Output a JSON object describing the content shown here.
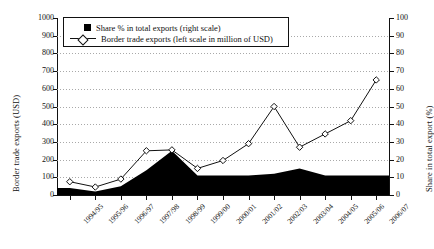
{
  "axes": {
    "left_title": "Border trade exports (USD)",
    "right_title": "Share in total export (%)",
    "left_ticks": [
      "1000",
      "900",
      "800",
      "700",
      "600",
      "500",
      "400",
      "300",
      "200",
      "100",
      "0"
    ],
    "right_ticks": [
      "100",
      "90",
      "80",
      "70",
      "60",
      "50",
      "40",
      "30",
      "20",
      "10",
      "0"
    ]
  },
  "legend": {
    "share_label": "Share % in total exports (right scale)",
    "border_label": "Border trade exports (left scale in million of USD)",
    "share_marker": "filled-square-black",
    "border_marker": "open-diamond-with-line"
  },
  "chart_data": {
    "type": "line",
    "title": "",
    "xlabel": "",
    "ylabel": "Border trade exports (USD)",
    "y2label": "Share in total export (%)",
    "ylim": [
      0,
      1000
    ],
    "y2lim": [
      0,
      100
    ],
    "grid": true,
    "legend_position": "top-left-inside",
    "categories": [
      "1994/95",
      "1995/96",
      "1996/97",
      "1997/98",
      "1998/99",
      "1999/00",
      "2000/01",
      "2001/02",
      "2002/03",
      "2003/04",
      "2004/05",
      "2005/06",
      "2006/07"
    ],
    "series": [
      {
        "name": "Border trade exports (left scale in million of USD)",
        "type": "line",
        "axis": "left",
        "marker": "diamond",
        "color": "#111111",
        "values": [
          75,
          45,
          90,
          250,
          255,
          150,
          195,
          290,
          500,
          270,
          345,
          420,
          650
        ]
      },
      {
        "name": "Share % in total exports (right scale)",
        "type": "area",
        "axis": "right",
        "color": "#000000",
        "values": [
          4,
          2,
          5,
          14,
          25,
          11,
          11,
          11,
          12,
          15,
          11,
          11,
          11
        ]
      }
    ]
  }
}
